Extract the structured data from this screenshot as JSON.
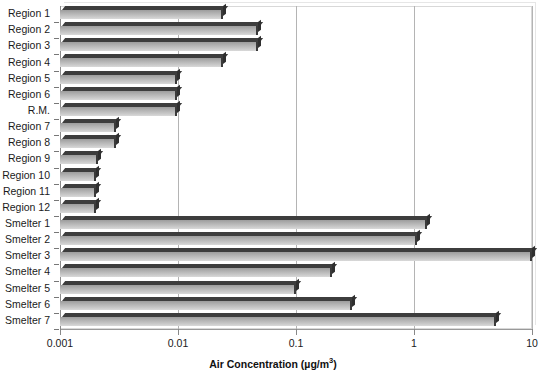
{
  "chart_data": {
    "type": "bar",
    "orientation": "horizontal",
    "title": "",
    "xlabel": "Air Concentration (µg/m³)",
    "ylabel": "",
    "xscale": "log",
    "xlim": [
      0.001,
      10
    ],
    "xticks": [
      0.001,
      0.01,
      0.1,
      1,
      10
    ],
    "xticklabels": [
      "0.001",
      "0.01",
      "0.1",
      "1",
      "10"
    ],
    "grid": "vertical",
    "legend": "none",
    "categories": [
      "Region 1",
      "Region 2",
      "Region 3",
      "Region 4",
      "Region 5",
      "Region 6",
      "R.M.",
      "Region 7",
      "Region 8",
      "Region 9",
      "Region 10",
      "Region 11",
      "Region 12",
      "Smelter 1",
      "Smelter 2",
      "Smelter 3",
      "Smelter 4",
      "Smelter 5",
      "Smelter 6",
      "Smelter 7"
    ],
    "values": [
      0.024,
      0.048,
      0.048,
      0.024,
      0.0098,
      0.0098,
      0.0098,
      0.003,
      0.003,
      0.0021,
      0.002,
      0.002,
      0.002,
      1.3,
      1.05,
      10.0,
      0.2,
      0.1,
      0.3,
      5.0
    ],
    "units": "µg/m³"
  },
  "axis": {
    "x_title_main": "Air Concentration (µg/m",
    "x_title_sup": "3",
    "x_title_close": ")"
  },
  "colors": {
    "bar_face": "#bdbdbd",
    "bar_edge": "#333333",
    "gridline": "#b4b4b4",
    "axis": "#999999",
    "text": "#1a1a1a",
    "background": "#ffffff"
  }
}
